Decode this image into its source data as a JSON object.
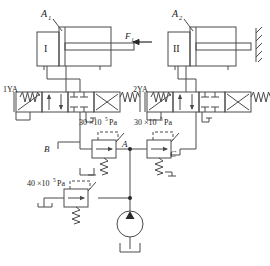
{
  "figure": {
    "type": "hydraulic-circuit-schematic",
    "line_color": "#4a4a4a",
    "text_color": "#1a1a1a",
    "background": "#ffffff"
  },
  "cylinders": [
    {
      "id": "cylinder-1",
      "area_label": "A",
      "area_sub": "1",
      "body_label": "I",
      "has_wall": false
    },
    {
      "id": "cylinder-2",
      "area_label": "A",
      "area_sub": "2",
      "body_label": "II",
      "has_wall": true
    }
  ],
  "force": {
    "label": "F",
    "sub": "1"
  },
  "solenoids": [
    {
      "id": "solenoid-1",
      "label": "1YA"
    },
    {
      "id": "solenoid-2",
      "label": "2YA"
    }
  ],
  "pressure_settings": [
    {
      "id": "sequence-valve-left",
      "value": "30",
      "multiplier": "×10",
      "exponent": "5",
      "unit": "Pa",
      "full": "30×10⁵ Pa"
    },
    {
      "id": "sequence-valve-right",
      "value": "30",
      "multiplier": "×10",
      "exponent": "5",
      "unit": "Pa",
      "full": "30×10⁵ Pa"
    },
    {
      "id": "relief-valve-pump",
      "value": "40",
      "multiplier": "×10",
      "exponent": "5",
      "unit": "Pa",
      "full": "40×10⁵ Pa"
    }
  ],
  "nodes": [
    {
      "id": "node-b",
      "label": "B"
    },
    {
      "id": "node-a",
      "label": "A"
    },
    {
      "id": "node-c",
      "label": "C"
    }
  ],
  "components": {
    "pump": "hydraulic-pump",
    "tank": "reservoir-tank",
    "directional_valves": 2,
    "sequence_valves": 2,
    "relief_valves": 1
  }
}
